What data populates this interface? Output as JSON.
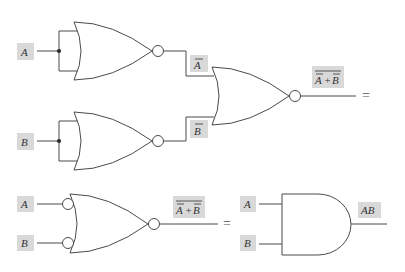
{
  "diagram": {
    "title": "",
    "top_circuit": {
      "gate1": {
        "type": "NOR",
        "input_label": "A",
        "output_label": "A",
        "output_negated": true
      },
      "gate2": {
        "type": "NOR",
        "input_label": "B",
        "output_label": "B",
        "output_negated": true
      },
      "gate3": {
        "type": "NOR",
        "inputs": [
          "Ā",
          "B̄"
        ],
        "output_label_a": "A",
        "output_label_plus": "+",
        "output_label_b": "B"
      },
      "equals": "="
    },
    "bottom_circuit": {
      "negative_or_gate": {
        "type": "NOR with inverted inputs",
        "input_a": "A",
        "input_b": "B",
        "output_label_a": "A",
        "output_label_plus": "+",
        "output_label_b": "B"
      },
      "equals": "=",
      "and_gate": {
        "type": "AND",
        "input_a": "A",
        "input_b": "B",
        "output_label": "AB"
      }
    },
    "colors": {
      "line": "#4a4a4a",
      "label_box": "#d9d9d9",
      "background": "#ffffff"
    }
  }
}
